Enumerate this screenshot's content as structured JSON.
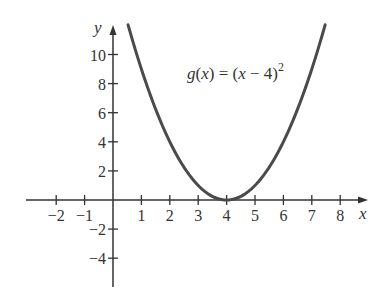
{
  "chart_data": {
    "type": "line",
    "title": "",
    "xlabel": "x",
    "ylabel": "y",
    "xlim": [
      -2.5,
      8.9
    ],
    "ylim": [
      -6,
      12
    ],
    "grid": false,
    "x_ticks": [
      -2,
      -1,
      1,
      2,
      3,
      4,
      5,
      6,
      7,
      8
    ],
    "x_tick_labels": [
      "−2",
      "−1",
      "1",
      "2",
      "3",
      "4",
      "5",
      "6",
      "7",
      "8"
    ],
    "y_ticks": [
      10,
      8,
      6,
      4,
      2,
      -2,
      -4
    ],
    "y_tick_labels": [
      "10",
      "8",
      "6",
      "4",
      "2",
      "−2",
      "−4"
    ],
    "series": [
      {
        "name": "g(x) = (x − 4)^2",
        "function": "(x-4)^2",
        "x": [
          0.53,
          1,
          2,
          3,
          4,
          5,
          6,
          7,
          7.47
        ],
        "values": [
          12.04,
          9,
          4,
          1,
          0,
          1,
          4,
          9,
          12.04
        ],
        "color": "#4a4a4a"
      }
    ],
    "annotations": [
      {
        "text": "g(x) = (x − 4)^2",
        "position": "upper right of vertex, left of right branch"
      }
    ],
    "vertex": {
      "x": 4,
      "y": 0
    }
  },
  "labels": {
    "x_axis": "x",
    "y_axis": "y",
    "equation": {
      "func": "g",
      "open": "(",
      "var": "x",
      "close_eq": ") = (",
      "var2": "x",
      "minus_four": " − 4)",
      "exponent": "2"
    }
  },
  "colors": {
    "curve": "#4a4a4a",
    "axis": "#333333",
    "background": "#ffffff"
  }
}
